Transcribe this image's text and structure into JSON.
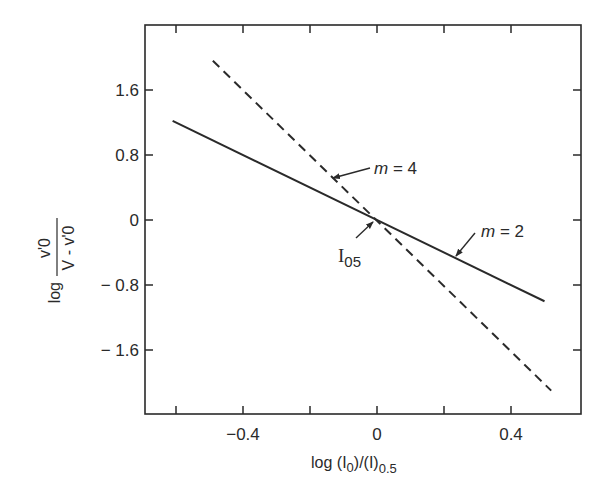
{
  "chart_data": {
    "type": "line",
    "title": "",
    "xlabel": "log (I0)/(I)0.5",
    "xlabel_parts": {
      "prefix": "log (I",
      "sub1": "0",
      "mid": ")/(I)",
      "sub2": "0.5"
    },
    "ylabel": "log v'0 / (V - v'0)",
    "ylabel_parts": {
      "log": "log",
      "numerator": "v'0",
      "denominator": "V - v'0"
    },
    "xlim": [
      -0.69,
      0.61
    ],
    "ylim": [
      -2.38,
      2.38
    ],
    "x_ticks": [
      -0.6,
      -0.4,
      -0.2,
      0,
      0.2,
      0.4
    ],
    "x_tick_labels": [
      {
        "value": -0.4,
        "label": "-0.4"
      },
      {
        "value": 0,
        "label": "0"
      },
      {
        "value": 0.4,
        "label": "0.4"
      }
    ],
    "y_ticks": [
      1.6,
      0.8,
      0,
      -0.8,
      -1.6
    ],
    "y_tick_labels": [
      {
        "value": 1.6,
        "label": "1.6"
      },
      {
        "value": 0.8,
        "label": "0.8"
      },
      {
        "value": 0,
        "label": "0"
      },
      {
        "value": -0.8,
        "label": "-0.8"
      },
      {
        "value": -1.6,
        "label": "-1.6"
      }
    ],
    "grid": false,
    "legend": null,
    "series": [
      {
        "name": "m = 2",
        "style": "solid",
        "slope": -2,
        "x": [
          -0.61,
          0.5
        ],
        "y": [
          1.22,
          -1.0
        ]
      },
      {
        "name": "m = 4",
        "style": "dashed",
        "slope": -4,
        "x": [
          -0.49,
          0.52
        ],
        "y": [
          1.96,
          -2.1
        ]
      }
    ],
    "annotations": [
      {
        "text": "m = 4",
        "italic_var": "m",
        "rest": " = 4",
        "target": "dashed line",
        "arrow_to": [
          -0.13,
          0.5
        ]
      },
      {
        "text": "m = 2",
        "italic_var": "m",
        "rest": " = 2",
        "target": "solid line",
        "arrow_to": [
          0.22,
          -0.45
        ]
      },
      {
        "text": "I05",
        "main": "I",
        "sub": "05",
        "target": "intersection",
        "arrow_to": [
          0,
          0
        ]
      }
    ]
  },
  "colors": {
    "ink": "#2a2a2a",
    "background": "#ffffff"
  }
}
